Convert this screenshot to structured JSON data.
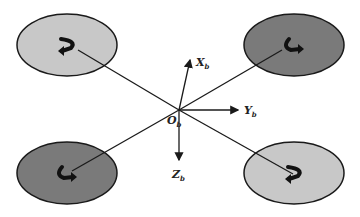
{
  "diagram": {
    "origin": {
      "label": "O",
      "subscript": "b",
      "x": 179,
      "y": 110
    },
    "axes": [
      {
        "id": "x",
        "label": "X",
        "subscript": "b",
        "to": [
          190,
          60
        ],
        "label_pos": [
          196,
          66
        ]
      },
      {
        "id": "y",
        "label": "Y",
        "subscript": "b",
        "to": [
          238,
          110
        ],
        "label_pos": [
          244,
          114
        ]
      },
      {
        "id": "z",
        "label": "Z",
        "subscript": "b",
        "to": [
          179,
          160
        ],
        "label_pos": [
          172,
          178
        ]
      }
    ],
    "rotors": [
      {
        "id": "front-left",
        "cx": 67,
        "cy": 45,
        "rx": 50,
        "ry": 31,
        "fill": "#c8c8c8",
        "hub": [
          78,
          50
        ],
        "rotation": "counterclockwise"
      },
      {
        "id": "front-right",
        "cx": 294,
        "cy": 45,
        "rx": 50,
        "ry": 31,
        "fill": "#7a7a7a",
        "hub": [
          282,
          50
        ],
        "rotation": "clockwise"
      },
      {
        "id": "rear-left",
        "cx": 67,
        "cy": 173,
        "rx": 50,
        "ry": 31,
        "fill": "#7a7a7a",
        "hub": [
          72,
          171
        ],
        "rotation": "clockwise"
      },
      {
        "id": "rear-right",
        "cx": 294,
        "cy": 173,
        "rx": 50,
        "ry": 31,
        "fill": "#c8c8c8",
        "hub": [
          293,
          174
        ],
        "rotation": "counterclockwise"
      }
    ],
    "stroke_color": "#1a1a1a"
  }
}
